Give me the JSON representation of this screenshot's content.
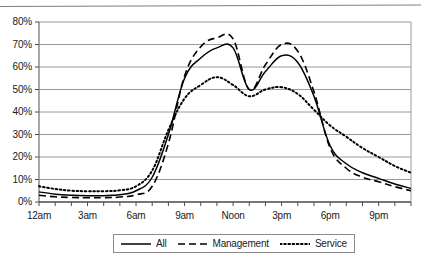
{
  "chart_data": {
    "type": "line",
    "title": "",
    "subtitle": "",
    "xlabel": "",
    "ylabel": "",
    "grid": true,
    "legend_position": "bottom",
    "xlim": [
      0,
      23
    ],
    "ylim": [
      0,
      80
    ],
    "y_ticks": [
      0,
      10,
      20,
      30,
      40,
      50,
      60,
      70,
      80
    ],
    "y_tick_labels": [
      "0%",
      "10%",
      "20%",
      "30%",
      "40%",
      "50%",
      "60%",
      "70%",
      "80%"
    ],
    "x": [
      0,
      1,
      2,
      3,
      4,
      5,
      6,
      7,
      8,
      9,
      10,
      11,
      12,
      13,
      14,
      15,
      16,
      17,
      18,
      19,
      20,
      21,
      22,
      23
    ],
    "x_tick_labels": [
      "12am",
      "",
      "",
      "3am",
      "",
      "",
      "6am",
      "",
      "",
      "9am",
      "",
      "",
      "Noon",
      "",
      "",
      "3pm",
      "",
      "",
      "6pm",
      "",
      "",
      "9pm",
      "",
      ""
    ],
    "x_labeled_ticks": [
      {
        "index": 0,
        "label": "12am"
      },
      {
        "index": 3,
        "label": "3am"
      },
      {
        "index": 6,
        "label": "6am"
      },
      {
        "index": 9,
        "label": "9am"
      },
      {
        "index": 12,
        "label": "Noon"
      },
      {
        "index": 15,
        "label": "3pm"
      },
      {
        "index": 18,
        "label": "6pm"
      },
      {
        "index": 21,
        "label": "9pm"
      }
    ],
    "series": [
      {
        "name": "All",
        "style": "solid",
        "color": "#000000",
        "values": [
          4.5,
          3.5,
          3.0,
          2.8,
          2.8,
          3.2,
          5.0,
          11.0,
          30.0,
          55.0,
          64.0,
          68.5,
          68.5,
          50.0,
          58.0,
          65.0,
          62.0,
          47.0,
          25.0,
          17.0,
          13.0,
          10.5,
          8.0,
          6.0
        ]
      },
      {
        "name": "Management",
        "style": "dashed",
        "color": "#000000",
        "values": [
          3.0,
          2.3,
          2.0,
          1.9,
          1.9,
          2.2,
          3.2,
          7.0,
          26.0,
          56.0,
          69.0,
          73.0,
          72.5,
          50.0,
          61.0,
          70.0,
          67.0,
          49.0,
          24.0,
          15.0,
          11.0,
          9.0,
          6.8,
          5.0
        ]
      },
      {
        "name": "Service",
        "style": "dotted",
        "color": "#000000",
        "values": [
          7.0,
          5.8,
          5.0,
          4.8,
          4.8,
          5.2,
          7.0,
          14.0,
          32.0,
          46.0,
          52.0,
          55.5,
          52.0,
          47.0,
          50.0,
          51.0,
          48.0,
          41.0,
          34.0,
          29.0,
          24.0,
          20.0,
          16.0,
          13.0
        ]
      }
    ]
  },
  "legend": {
    "items": [
      {
        "label": "All",
        "style": "solid"
      },
      {
        "label": "Management",
        "style": "dashed"
      },
      {
        "label": "Service",
        "style": "dotted"
      }
    ]
  }
}
